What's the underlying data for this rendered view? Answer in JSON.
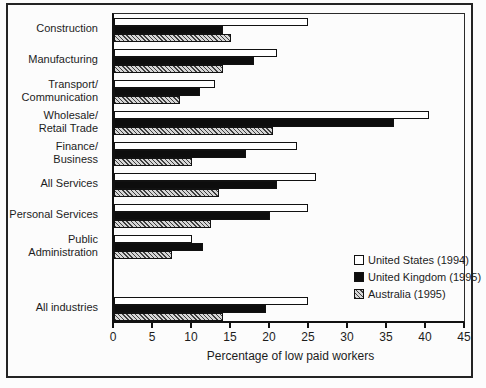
{
  "chart_data": {
    "type": "bar",
    "orientation": "horizontal",
    "title": "",
    "xlabel": "Percentage of low paid workers",
    "ylabel": "",
    "xlim": [
      0,
      45
    ],
    "xticks": [
      0,
      5,
      10,
      15,
      20,
      25,
      30,
      35,
      40,
      45
    ],
    "grid": false,
    "legend_position": "right-middle",
    "blank_row_before_index": 8,
    "categories": [
      "Construction",
      "Manufacturing",
      "Transport/\nCommunication",
      "Wholesale/\nRetail Trade",
      "Finance/\nBusiness",
      "All Services",
      "Personal Services",
      "Public\nAdministration",
      "All industries"
    ],
    "series": [
      {
        "key": "us",
        "name": "United States (1994)",
        "style": "white",
        "values": [
          25,
          21,
          13,
          40.5,
          23.5,
          26,
          25,
          10,
          25
        ]
      },
      {
        "key": "uk",
        "name": "United Kingdom (1995)",
        "style": "black",
        "values": [
          14,
          18,
          11,
          36,
          17,
          21,
          20,
          11.5,
          19.5
        ]
      },
      {
        "key": "au",
        "name": "Australia (1995)",
        "style": "hatch",
        "values": [
          15,
          14,
          8.5,
          20.5,
          10,
          13.5,
          12.5,
          7.5,
          14
        ]
      }
    ],
    "colors": {
      "frame": "#242424",
      "bar_outline": "#111111",
      "black_fill": "#0d0d0d",
      "hatch_base": "#d6d6d6",
      "hatch_line": "#3f3f3f",
      "text": "#1c1c1c",
      "background": "#fcfcfc"
    }
  }
}
